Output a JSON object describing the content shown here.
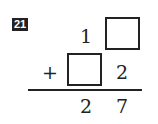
{
  "problem": {
    "number": "21",
    "row1": {
      "tens": "1",
      "ones_blank": true
    },
    "operator": "+",
    "row2": {
      "tens_blank": true,
      "ones": "2"
    },
    "result": {
      "tens": "2",
      "ones": "7"
    }
  }
}
